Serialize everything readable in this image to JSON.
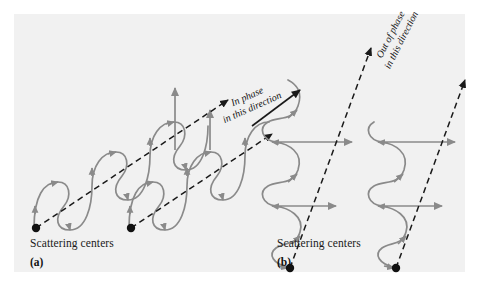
{
  "figure": {
    "background_color": "#ffffff",
    "panel_color": "#f1f1f1",
    "wave_color": "#8a8a8a",
    "line_color": "#1a1a1a",
    "dot_color": "#111111"
  },
  "panels": [
    {
      "id": "a",
      "letter": "(a)",
      "caption": "Scattering centers",
      "direction_label_line1": "In phase",
      "direction_label_line2": "in this direction",
      "scattering_centers": 2,
      "wave_trains": 2,
      "dashed_rays": 2,
      "vertical_arrows": 2
    },
    {
      "id": "b",
      "letter": "(b)",
      "caption": "Scattering centers",
      "direction_label_line1": "Out of phase",
      "direction_label_line2": "in this direction",
      "scattering_centers": 2,
      "wave_trains": 2,
      "dashed_rays": 2,
      "vertical_arrows": 0
    }
  ]
}
